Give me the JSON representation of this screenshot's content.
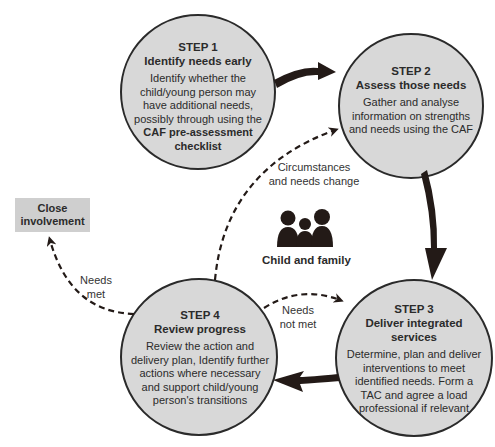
{
  "colors": {
    "circle_fill": "#d8d8d8",
    "circle_stroke": "#2a2a2a",
    "arrow": "#231a17",
    "box_fill": "#cfcfcf"
  },
  "steps": [
    {
      "number": "STEP 1",
      "title": "Identify needs early",
      "description": "Identify whether the child/young person may have additional needs, possibly through using the",
      "description_bold": "CAF pre-assessment checklist"
    },
    {
      "number": "STEP 2",
      "title": "Assess those needs",
      "description": "Gather and analyse information on strengths and needs using the CAF"
    },
    {
      "number": "STEP 3",
      "title": "Deliver integrated services",
      "description": "Determine, plan and deliver interventions to meet identified needs. Form a TAC and agree a load professional if relevant"
    },
    {
      "number": "STEP 4",
      "title": "Review progress",
      "description": "Review the action and delivery plan, Identify further actions where necessary and support child/young person's transitions"
    }
  ],
  "center": {
    "icon": "family-icon",
    "label": "Child and family"
  },
  "labels": {
    "circumstances": "Circumstances and needs change",
    "needs_met": "Needs met",
    "needs_not_met": "Needs not met"
  },
  "close_box": {
    "label": "Close involvement"
  }
}
